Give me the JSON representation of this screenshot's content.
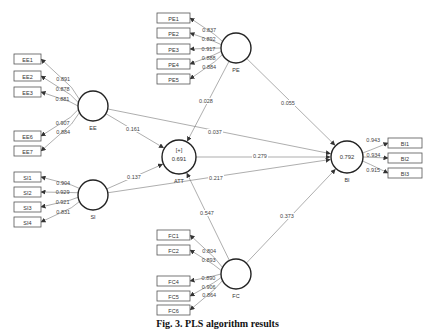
{
  "caption": "Fig. 3. PLS algorithm results",
  "constructs": {
    "PE": {
      "label": "PE",
      "cx": 236,
      "cy": 48,
      "r": 15,
      "r2": ""
    },
    "EE": {
      "label": "EE",
      "cx": 93,
      "cy": 106,
      "r": 15,
      "r2": ""
    },
    "SI": {
      "label": "SI",
      "cx": 93,
      "cy": 195,
      "r": 15,
      "r2": ""
    },
    "ATT": {
      "label": "ATT",
      "cx": 179,
      "cy": 157,
      "r": 17,
      "r2": "0.691",
      "tag": "[+]"
    },
    "BI": {
      "label": "BI",
      "cx": 347,
      "cy": 157,
      "r": 16,
      "r2": "0.792"
    },
    "FC": {
      "label": "FC",
      "cx": 236,
      "cy": 274,
      "r": 15,
      "r2": ""
    }
  },
  "indicators": {
    "PE": [
      {
        "label": "PE1",
        "loading": "0.837",
        "x": 157,
        "y": 13
      },
      {
        "label": "PE2",
        "loading": "0.892",
        "x": 157,
        "y": 28
      },
      {
        "label": "PE3",
        "loading": "0.917",
        "x": 157,
        "y": 44
      },
      {
        "label": "PE4",
        "loading": "0.888",
        "x": 157,
        "y": 59
      },
      {
        "label": "PE5",
        "loading": "0.884",
        "x": 157,
        "y": 74
      }
    ],
    "EE": [
      {
        "label": "EE1",
        "loading": "0.891",
        "x": 14,
        "y": 54
      },
      {
        "label": "EE2",
        "loading": "0.878",
        "x": 14,
        "y": 71
      },
      {
        "label": "EE3",
        "loading": "0.881",
        "x": 14,
        "y": 87
      },
      {
        "label": "EE6",
        "loading": "0.907",
        "x": 14,
        "y": 131
      },
      {
        "label": "EE7",
        "loading": "0.884",
        "x": 14,
        "y": 146
      }
    ],
    "SI": [
      {
        "label": "SI1",
        "loading": "0.904",
        "x": 14,
        "y": 172
      },
      {
        "label": "SI2",
        "loading": "0.929",
        "x": 14,
        "y": 187
      },
      {
        "label": "SI3",
        "loading": "0.921",
        "x": 14,
        "y": 202
      },
      {
        "label": "SI4",
        "loading": "0.831",
        "x": 14,
        "y": 217
      }
    ],
    "BI": [
      {
        "label": "BI1",
        "loading": "0.943",
        "x": 388,
        "y": 138
      },
      {
        "label": "BI2",
        "loading": "0.934",
        "x": 388,
        "y": 153
      },
      {
        "label": "BI3",
        "loading": "0.915",
        "x": 388,
        "y": 168
      }
    ],
    "FC": [
      {
        "label": "FC1",
        "loading": "0.804",
        "x": 157,
        "y": 230
      },
      {
        "label": "FC2",
        "loading": "0.893",
        "x": 157,
        "y": 245
      },
      {
        "label": "FC4",
        "loading": "0.890",
        "x": 157,
        "y": 276
      },
      {
        "label": "FC5",
        "loading": "0.906",
        "x": 157,
        "y": 291
      },
      {
        "label": "FC6",
        "loading": "0.864",
        "x": 157,
        "y": 305
      }
    ]
  },
  "paths": [
    {
      "from": "PE",
      "to": "ATT",
      "coef": "0.028",
      "lx": 206,
      "ly": 103
    },
    {
      "from": "PE",
      "to": "BI",
      "coef": "0.055",
      "lx": 288,
      "ly": 105
    },
    {
      "from": "EE",
      "to": "ATT",
      "coef": "0.161",
      "lx": 133,
      "ly": 131
    },
    {
      "from": "EE",
      "to": "BI",
      "coef": "0.037",
      "lx": 215,
      "ly": 134
    },
    {
      "from": "SI",
      "to": "ATT",
      "coef": "0.137",
      "lx": 134,
      "ly": 179
    },
    {
      "from": "SI",
      "to": "BI",
      "coef": "0.217",
      "lx": 216,
      "ly": 180
    },
    {
      "from": "ATT",
      "to": "BI",
      "coef": "0.279",
      "lx": 260,
      "ly": 158
    },
    {
      "from": "FC",
      "to": "ATT",
      "coef": "0.547",
      "lx": 207,
      "ly": 215
    },
    {
      "from": "FC",
      "to": "BI",
      "coef": "0.373",
      "lx": 287,
      "ly": 218
    }
  ]
}
